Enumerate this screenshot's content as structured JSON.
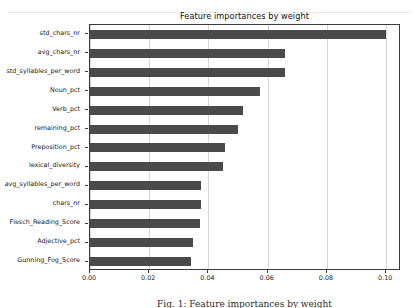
{
  "chart_data": {
    "type": "bar",
    "orientation": "horizontal",
    "title": "Feature importances by weight",
    "xlabel": "",
    "ylabel": "",
    "xlim": [
      0.0,
      0.105
    ],
    "ylim": [
      0,
      13
    ],
    "grid": true,
    "grid_axis": "x",
    "legend": null,
    "bar_color": "#4a4a4a",
    "categories": [
      "std_chars_nr",
      "avg_chars_nr",
      "std_syllables_per_word",
      "Noun_pct",
      "Verb_pct",
      "remaining_pct",
      "Preposition_pct",
      "lexical_diversity",
      "avg_syllables_per_word",
      "chars_nr",
      "Flesch_Reading_Score",
      "Adjective_pct",
      "Gunning_Fog_Score"
    ],
    "values": [
      0.1,
      0.066,
      0.066,
      0.0575,
      0.0515,
      0.05,
      0.0455,
      0.0448,
      0.0375,
      0.0375,
      0.0373,
      0.0348,
      0.0342
    ],
    "xticks": [
      0.0,
      0.02,
      0.04,
      0.06,
      0.08,
      0.1
    ],
    "xticklabels": [
      "0.00",
      "0.02",
      "0.04",
      "0.06",
      "0.08",
      "0.10"
    ]
  },
  "caption": {
    "text": "Fig. 1: Feature importances by weight"
  }
}
